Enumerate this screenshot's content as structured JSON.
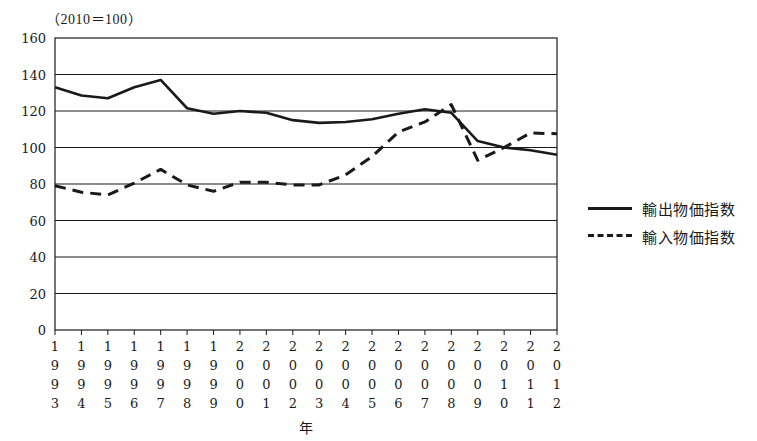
{
  "unit_note": "（2010＝100）",
  "axis": {
    "x_title": "年",
    "y_ticks": [
      "0",
      "20",
      "40",
      "60",
      "80",
      "100",
      "120",
      "140",
      "160"
    ],
    "x_tick_labels": [
      "1993",
      "1994",
      "1995",
      "1996",
      "1997",
      "1998",
      "1999",
      "2000",
      "2001",
      "2002",
      "2003",
      "2004",
      "2005",
      "2006",
      "2007",
      "2008",
      "2009",
      "2010",
      "2011",
      "2012"
    ]
  },
  "legend": {
    "position": "right",
    "items": [
      {
        "label": "輸出物価指数",
        "style": "solid"
      },
      {
        "label": "輸入物価指数",
        "style": "dashed"
      }
    ]
  },
  "chart_data": {
    "type": "line",
    "title": "",
    "subtitle": "",
    "xlabel": "年",
    "ylabel": "",
    "unit_note": "（2010＝100）",
    "ylim": [
      0,
      160
    ],
    "ytick_step": 20,
    "grid": true,
    "grid_axis": "y",
    "legend_position": "right",
    "x": [
      1993,
      1994,
      1995,
      1996,
      1997,
      1998,
      1999,
      2000,
      2001,
      2002,
      2003,
      2004,
      2005,
      2006,
      2007,
      2008,
      2009,
      2010,
      2011,
      2012
    ],
    "categories": [
      "1993",
      "1994",
      "1995",
      "1996",
      "1997",
      "1998",
      "1999",
      "2000",
      "2001",
      "2002",
      "2003",
      "2004",
      "2005",
      "2006",
      "2007",
      "2008",
      "2009",
      "2010",
      "2011",
      "2012"
    ],
    "series": [
      {
        "name": "輸出物価指数",
        "style": "solid",
        "color": "#1a1a1a",
        "values": [
          133.0,
          128.5,
          127.0,
          133.0,
          137.0,
          121.5,
          118.5,
          120.0,
          119.0,
          115.0,
          113.5,
          114.0,
          115.5,
          118.5,
          121.0,
          119.0,
          103.5,
          100.0,
          98.5,
          96.0
        ]
      },
      {
        "name": "輸入物価指数",
        "style": "dashed",
        "color": "#1a1a1a",
        "values": [
          79.0,
          75.5,
          74.0,
          80.5,
          88.0,
          79.5,
          76.0,
          81.0,
          81.0,
          79.5,
          79.5,
          85.0,
          95.0,
          108.5,
          114.0,
          123.5,
          93.0,
          100.0,
          108.0,
          107.5
        ]
      }
    ]
  }
}
